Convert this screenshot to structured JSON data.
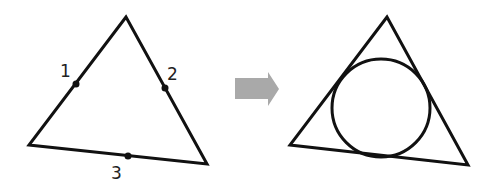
{
  "diagram": {
    "left": {
      "triangle": [
        [
          126,
          17
        ],
        [
          29,
          145
        ],
        [
          207,
          164
        ]
      ],
      "points": [
        {
          "label": "1",
          "x": 76,
          "y": 84,
          "lx": 60,
          "ly": 77
        },
        {
          "label": "2",
          "x": 165,
          "y": 88,
          "lx": 167,
          "ly": 80
        },
        {
          "label": "3",
          "x": 128,
          "y": 156,
          "lx": 111,
          "ly": 179
        }
      ]
    },
    "arrow": {
      "color": "#a9a9a9"
    },
    "right": {
      "triangle": [
        [
          387,
          17
        ],
        [
          290,
          145
        ],
        [
          468,
          165
        ]
      ],
      "incircle": {
        "cx": 381,
        "cy": 108,
        "r": 49
      }
    },
    "stroke_color": "#111111"
  }
}
